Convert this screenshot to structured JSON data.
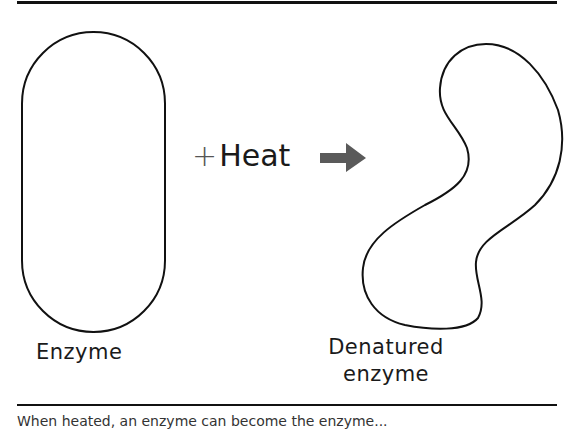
{
  "diagram": {
    "left_shape": {
      "label": "Enzyme",
      "shape": "capsule"
    },
    "transition": {
      "operator": "+",
      "label": "Heat",
      "arrow": "right-arrow-icon",
      "arrow_color": "#5a5a5a"
    },
    "right_shape": {
      "label_line1": "Denatured",
      "label_line2": "enzyme",
      "shape": "irregular-blob"
    },
    "caption": "When heated, an enzyme can become the enzyme..."
  }
}
